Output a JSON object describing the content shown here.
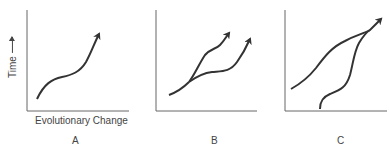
{
  "diagram": {
    "y_axis_label": "Time",
    "x_axis_label": "Evolutionary Change",
    "panels": [
      {
        "id": "A",
        "label": "A",
        "description": "single lineage curve rising over time"
      },
      {
        "id": "B",
        "label": "B",
        "description": "lineage splits into two branches, both rising"
      },
      {
        "id": "C",
        "label": "C",
        "description": "two separate lineages converging to one"
      }
    ],
    "colors": {
      "line": "#333333",
      "axis": "#555555"
    }
  }
}
